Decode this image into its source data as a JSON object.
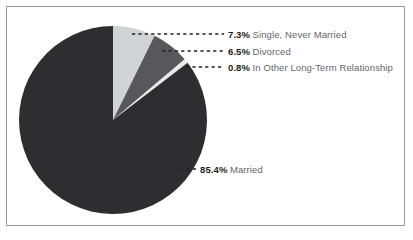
{
  "chart_data": {
    "type": "pie",
    "title": "",
    "subtitle": "",
    "xlabel": "",
    "ylabel": "",
    "legend_position": "callout-labels",
    "grid": false,
    "start_angle_deg": 0,
    "direction": "clockwise",
    "categories": [
      "Single, Never Married",
      "Divorced",
      "In Other Long-Term Relationship",
      "Married"
    ],
    "values": [
      7.3,
      6.5,
      0.8,
      85.4
    ],
    "value_labels": [
      "7.3%",
      "6.5%",
      "0.8%",
      "85.4%"
    ],
    "colors": [
      "#d2d3d4",
      "#58585a",
      "#e8e9ea",
      "#2e2e30"
    ],
    "slices": [
      {
        "label": "Single, Never Married",
        "value": 7.3,
        "value_label": "7.3%",
        "color": "#d2d3d4"
      },
      {
        "label": "Divorced",
        "value": 6.5,
        "value_label": "6.5%",
        "color": "#58585a"
      },
      {
        "label": "In Other Long-Term Relationship",
        "value": 0.8,
        "value_label": "0.8%",
        "color": "#e8e9ea"
      },
      {
        "label": "Married",
        "value": 85.4,
        "value_label": "85.4%",
        "color": "#2e2e30"
      }
    ]
  },
  "style": {
    "border_color": "#9a9a9a",
    "background": "#ffffff",
    "label_text_color": "#63666a",
    "percent_text_color": "#231f20",
    "leader_color": "#231f20"
  }
}
